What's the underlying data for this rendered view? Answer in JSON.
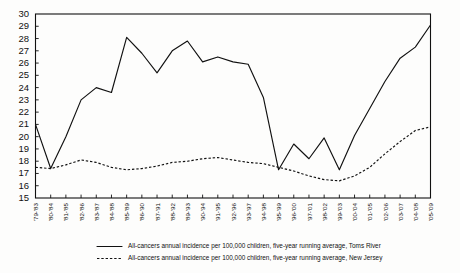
{
  "chart_data": {
    "type": "line",
    "title": "",
    "subtitle": "",
    "xlabel": "",
    "ylabel": "",
    "ylim": [
      15,
      30
    ],
    "yticks": [
      15,
      16,
      17,
      18,
      19,
      20,
      21,
      22,
      23,
      24,
      25,
      26,
      27,
      28,
      29,
      30
    ],
    "grid": false,
    "legend_position": "bottom",
    "categories": [
      "'79-'83",
      "'80-'84",
      "'81-'85",
      "'82-'86",
      "'83-'87",
      "'84-'88",
      "'85-'89",
      "'86-'90",
      "'87-'91",
      "'88-'92",
      "'89-'93",
      "'90-'94",
      "'91-'95",
      "'92-'96",
      "'93-'97",
      "'94-'98",
      "'95-'99",
      "'96-'00",
      "'97-'01",
      "'98-'02",
      "'99-'03",
      "'00-'04",
      "'01-'05",
      "'02-'06",
      "'03-'07",
      "'04-'08",
      "'05-'09"
    ],
    "series": [
      {
        "name": "All-cancers annual incidence per 100,000 children, five-year running average, Toms River",
        "style": "solid",
        "values": [
          21.0,
          17.4,
          20.0,
          23.0,
          24.0,
          23.6,
          28.1,
          26.8,
          25.2,
          27.0,
          27.8,
          26.1,
          26.5,
          26.1,
          25.9,
          23.2,
          17.3,
          19.4,
          18.2,
          19.9,
          17.3,
          20.1,
          22.3,
          24.5,
          26.4,
          27.3,
          29.1
        ]
      },
      {
        "name": "All-cancers annual incidence per 100,000 children, five-year running average, New Jersey",
        "style": "dashed",
        "values": [
          17.5,
          17.4,
          17.7,
          18.1,
          17.9,
          17.5,
          17.3,
          17.4,
          17.6,
          17.9,
          18.0,
          18.2,
          18.3,
          18.1,
          17.9,
          17.8,
          17.5,
          17.2,
          16.8,
          16.5,
          16.4,
          16.8,
          17.5,
          18.6,
          19.6,
          20.5,
          20.8
        ]
      }
    ]
  },
  "legend": {
    "entries": [
      {
        "label": "All-cancers annual incidence per 100,000 children, five-year running average, Toms River",
        "style": "solid"
      },
      {
        "label": "All-cancers annual incidence per 100,000 children, five-year running average, New Jersey",
        "style": "dashed"
      }
    ]
  },
  "colors": {
    "line": "#111111",
    "frame": "#111111",
    "background": "#fdfdfc",
    "text": "#111111"
  }
}
